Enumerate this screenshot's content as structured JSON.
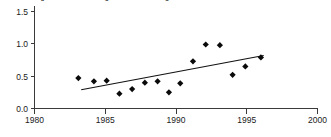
{
  "chart_data": {
    "type": "scatter",
    "title": "Figure: annual average index, trend regression fitted 1983-1996",
    "xlabel": "",
    "ylabel": "",
    "xlim": [
      1980,
      2000
    ],
    "ylim": [
      0.0,
      1.5
    ],
    "grid": false,
    "legend": "none",
    "xticks": [
      1980,
      1985,
      1990,
      1995,
      2000
    ],
    "xtick_labels": [
      "1980",
      "1985",
      "1990",
      "1995",
      "2000"
    ],
    "yticks": [
      0.0,
      0.5,
      1.0,
      1.5
    ],
    "ytick_labels": [
      "0.0",
      "0.5",
      "1.0",
      "1.5"
    ],
    "series": [
      {
        "name": "observations",
        "marker": "filled-diamond",
        "color": "#0a0a0a",
        "x": [
          1983.1,
          1984.2,
          1985.1,
          1986.0,
          1986.9,
          1987.8,
          1988.7,
          1989.5,
          1990.3,
          1991.2,
          1992.1,
          1993.1,
          1994.0,
          1994.9,
          1996.0
        ],
        "y": [
          0.47,
          0.42,
          0.43,
          0.23,
          0.3,
          0.4,
          0.42,
          0.25,
          0.39,
          0.73,
          0.99,
          0.98,
          0.52,
          0.65,
          0.79
        ]
      }
    ],
    "trend": {
      "name": "fitted regression line",
      "color": "#111111",
      "x": [
        1983.3,
        1996.2
      ],
      "y": [
        0.29,
        0.82
      ]
    }
  }
}
